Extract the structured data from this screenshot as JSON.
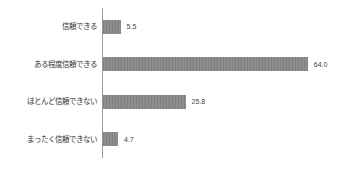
{
  "chart_data": {
    "type": "bar",
    "orientation": "horizontal",
    "title": "",
    "xlabel": "",
    "ylabel": "",
    "categories": [
      "信頼できる",
      "ある程度信頼できる",
      "ほとんど信頼できない",
      "まったく信頼できない"
    ],
    "values": [
      5.5,
      64.0,
      25.8,
      4.7
    ],
    "value_labels": [
      "5.5",
      "64.0",
      "25.8",
      "4.7"
    ],
    "xlim": [
      0,
      70
    ],
    "grid": false,
    "legend": "none",
    "bar_color": "#8a8a8a",
    "axis_color": "#9a9a9a",
    "text_color": "#333333"
  }
}
